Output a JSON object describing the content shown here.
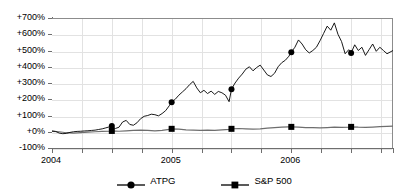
{
  "chart_data": {
    "type": "line",
    "title": "",
    "subtitle": "",
    "xlabel": "",
    "ylabel": "",
    "ylim": [
      -100,
      700
    ],
    "grid": "horizontal-and-vertical",
    "legend_position": "bottom-center",
    "y_ticks": [
      "+700%",
      "+600%",
      "+500%",
      "+400%",
      "+300%",
      "+200%",
      "+100%",
      "+0%",
      "-100%"
    ],
    "y_tick_values": [
      700,
      600,
      500,
      400,
      300,
      200,
      100,
      0,
      -100
    ],
    "x_ticks": [
      "2004",
      "2005",
      "2006"
    ],
    "x_tick_values": [
      2004,
      2005,
      2006
    ],
    "x_minor_ticks": [
      2004.0,
      2004.25,
      2004.5,
      2004.75,
      2005.0,
      2005.25,
      2005.5,
      2005.75,
      2006.0,
      2006.25,
      2006.5,
      2006.75
    ],
    "xlim": [
      2004.0,
      2006.85
    ],
    "series": [
      {
        "name": "ATPG",
        "marker": "circle",
        "color": "#000000",
        "marker_x": [
          2004.5,
          2005.0,
          2005.5,
          2006.0,
          2006.5
        ],
        "marker_y": [
          35,
          182,
          262,
          490,
          485
        ],
        "x": [
          2004.0,
          2004.03,
          2004.06,
          2004.09,
          2004.12,
          2004.15,
          2004.18,
          2004.21,
          2004.24,
          2004.27,
          2004.3,
          2004.33,
          2004.36,
          2004.39,
          2004.42,
          2004.45,
          2004.48,
          2004.5,
          2004.53,
          2004.56,
          2004.59,
          2004.62,
          2004.65,
          2004.68,
          2004.71,
          2004.74,
          2004.77,
          2004.8,
          2004.83,
          2004.86,
          2004.89,
          2004.92,
          2004.95,
          2004.98,
          2005.0,
          2005.03,
          2005.06,
          2005.09,
          2005.12,
          2005.15,
          2005.18,
          2005.21,
          2005.24,
          2005.27,
          2005.3,
          2005.33,
          2005.36,
          2005.39,
          2005.42,
          2005.45,
          2005.48,
          2005.5,
          2005.53,
          2005.56,
          2005.59,
          2005.62,
          2005.65,
          2005.68,
          2005.71,
          2005.74,
          2005.77,
          2005.8,
          2005.83,
          2005.86,
          2005.89,
          2005.92,
          2005.95,
          2005.98,
          2006.0,
          2006.03,
          2006.06,
          2006.09,
          2006.12,
          2006.15,
          2006.18,
          2006.21,
          2006.24,
          2006.27,
          2006.3,
          2006.33,
          2006.36,
          2006.39,
          2006.42,
          2006.45,
          2006.48,
          2006.5,
          2006.53,
          2006.56,
          2006.59,
          2006.62,
          2006.65,
          2006.68,
          2006.71,
          2006.74,
          2006.77,
          2006.8,
          2006.85
        ],
        "y": [
          5,
          2,
          -8,
          -12,
          -10,
          -4,
          0,
          2,
          3,
          5,
          6,
          8,
          10,
          14,
          18,
          24,
          30,
          35,
          20,
          28,
          60,
          70,
          45,
          40,
          55,
          80,
          95,
          100,
          108,
          105,
          98,
          112,
          130,
          160,
          182,
          200,
          225,
          245,
          265,
          290,
          310,
          270,
          240,
          255,
          235,
          250,
          230,
          248,
          240,
          225,
          185,
          262,
          300,
          330,
          355,
          385,
          400,
          375,
          395,
          410,
          380,
          350,
          340,
          360,
          400,
          425,
          440,
          465,
          490,
          520,
          565,
          540,
          505,
          485,
          500,
          520,
          560,
          605,
          650,
          625,
          670,
          600,
          555,
          480,
          505,
          485,
          535,
          500,
          520,
          470,
          505,
          540,
          495,
          520,
          500,
          480,
          500
        ]
      },
      {
        "name": "S&P 500",
        "marker": "square",
        "color": "#6e6e6e",
        "marker_x": [
          2004.5,
          2005.0,
          2005.5,
          2006.0,
          2006.5
        ],
        "marker_y": [
          5,
          18,
          18,
          30,
          30
        ],
        "x": [
          2004.0,
          2004.06,
          2004.12,
          2004.18,
          2004.24,
          2004.3,
          2004.36,
          2004.42,
          2004.48,
          2004.5,
          2004.56,
          2004.62,
          2004.68,
          2004.74,
          2004.8,
          2004.86,
          2004.92,
          2004.98,
          2005.0,
          2005.06,
          2005.12,
          2005.18,
          2005.24,
          2005.3,
          2005.36,
          2005.42,
          2005.48,
          2005.5,
          2005.56,
          2005.62,
          2005.68,
          2005.74,
          2005.8,
          2005.86,
          2005.92,
          2005.98,
          2006.0,
          2006.06,
          2006.12,
          2006.18,
          2006.24,
          2006.3,
          2006.36,
          2006.42,
          2006.48,
          2006.5,
          2006.56,
          2006.62,
          2006.68,
          2006.74,
          2006.8,
          2006.85
        ],
        "y": [
          2,
          0,
          -6,
          -8,
          -5,
          -2,
          0,
          2,
          4,
          5,
          3,
          6,
          8,
          10,
          8,
          6,
          9,
          14,
          18,
          16,
          12,
          10,
          8,
          10,
          9,
          12,
          15,
          18,
          20,
          18,
          16,
          18,
          22,
          25,
          28,
          30,
          30,
          28,
          26,
          25,
          24,
          26,
          28,
          27,
          29,
          30,
          28,
          27,
          29,
          31,
          33,
          35
        ]
      }
    ]
  },
  "legend": {
    "items": [
      {
        "label": "ATPG",
        "marker": "circle-marker"
      },
      {
        "label": "S&P 500",
        "marker": "square-marker"
      }
    ]
  }
}
